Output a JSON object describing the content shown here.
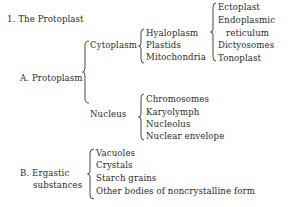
{
  "outline": {
    "heading": "1. The Protoplast",
    "protoplasm": {
      "label": "A. Protoplasm",
      "cytoplasm": {
        "label": "Cytoplasm",
        "items": [
          "Hyaloplasm",
          "Plastids",
          "Mitochondria"
        ],
        "membranes": [
          "Ectoplast",
          "Endoplasmic",
          "reticulum",
          "Dictyosomes",
          "Tonoplast"
        ]
      },
      "nucleus": {
        "label": "Nucleus",
        "items": [
          "Chromosomes",
          "Karyolymph",
          "Nucleolus",
          "Nuclear envelope"
        ]
      }
    },
    "ergastic": {
      "label_line1": "B. Ergastic",
      "label_line2": "substances",
      "items": [
        "Vacuoles",
        "Crystals",
        "Starch grains",
        "Other bodies of noncrystalline form"
      ]
    }
  }
}
